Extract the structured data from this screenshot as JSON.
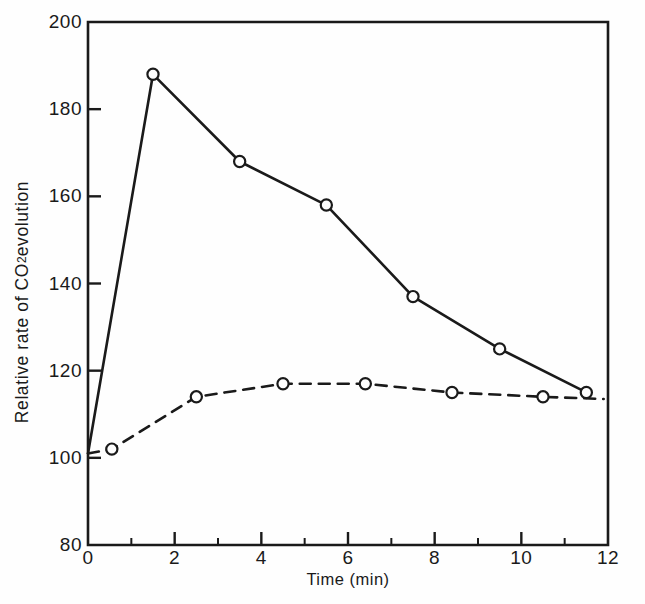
{
  "chart_data": {
    "type": "line",
    "title": "",
    "xlabel": "Time (min)",
    "ylabel": "Relative rate of CO2 evolution",
    "ylabel_parts": {
      "pre": "Relative rate of CO",
      "sub": "2",
      "post": " evolution"
    },
    "xlim": [
      0,
      12
    ],
    "ylim": [
      80,
      200
    ],
    "xticks": [
      0,
      2,
      4,
      6,
      8,
      10,
      12
    ],
    "xtick_labels": [
      "0",
      "2",
      "4",
      "6",
      "8",
      "10",
      "12"
    ],
    "yticks": [
      80,
      100,
      120,
      140,
      160,
      180,
      200
    ],
    "ytick_labels": [
      "80",
      "100",
      "120",
      "140",
      "160",
      "180",
      "200"
    ],
    "xminor_ticks": [
      1,
      3,
      5,
      7,
      9,
      11
    ],
    "grid": false,
    "legend": "none",
    "marker": "open-circle",
    "series": [
      {
        "name": "solid-series",
        "style": "solid",
        "color": "#1a1a1a",
        "x": [
          0,
          1.5,
          3.5,
          5.5,
          7.5,
          9.5,
          11.5
        ],
        "y": [
          101,
          188,
          168,
          158,
          137,
          125,
          115
        ],
        "marker_x": [
          1.5,
          3.5,
          5.5,
          7.5,
          9.5,
          11.5
        ],
        "marker_y": [
          188,
          168,
          158,
          137,
          125,
          115
        ]
      },
      {
        "name": "dashed-series",
        "style": "dashed",
        "color": "#1a1a1a",
        "x": [
          0,
          0.55,
          2.5,
          4.5,
          6.4,
          8.4,
          10.5,
          11.9
        ],
        "y": [
          101,
          102,
          114,
          117,
          117,
          115,
          114,
          113.5
        ],
        "marker_x": [
          0.55,
          2.5,
          4.5,
          6.4,
          8.4,
          10.5
        ],
        "marker_y": [
          102,
          114,
          117,
          117,
          115,
          114
        ]
      }
    ]
  },
  "figure": {
    "axis_color": "#1a1a1a",
    "background": "#fefefe"
  }
}
